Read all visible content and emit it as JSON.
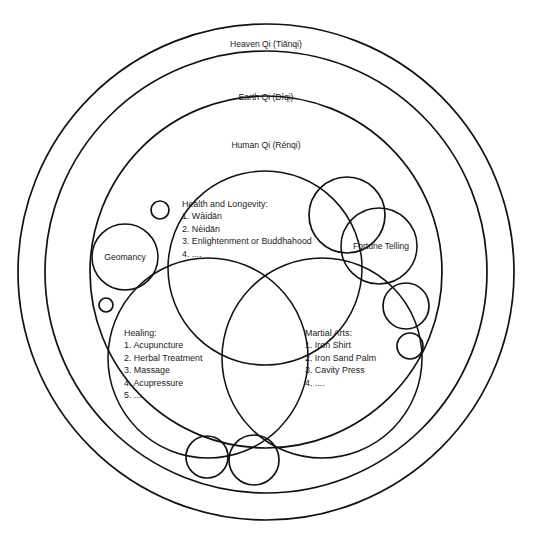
{
  "diagram": {
    "title_rings": [
      {
        "id": "heaven",
        "label": "Heaven Qi (Tiānqi)",
        "cx": 266,
        "cy": 272,
        "r": 248,
        "label_x": 266,
        "label_y": 47
      },
      {
        "id": "earth",
        "label": "Earth Qi (Dìqi)",
        "cx": 266,
        "cy": 272,
        "r": 221,
        "label_x": 266,
        "label_y": 100
      },
      {
        "id": "human",
        "label": "Human Qi (Rénqi)",
        "cx": 266,
        "cy": 272,
        "r": 176,
        "label_x": 266,
        "label_y": 148
      }
    ],
    "domains": [
      {
        "id": "health",
        "heading": "Health and Longevity:",
        "items": [
          "1. Wàidān",
          "2. Nèidān",
          "3. Enlightenment or Buddhahood",
          "4. ...."
        ],
        "cx": 265,
        "cy": 268,
        "r": 97,
        "text_x": 182,
        "text_y": 207
      },
      {
        "id": "healing",
        "heading": "Healing:",
        "items": [
          "1. Acupuncture",
          "2. Herbal Treatment",
          "3. Massage",
          "4. Acupressure",
          "5. ...."
        ],
        "cx": 208,
        "cy": 358,
        "r": 100,
        "text_x": 124,
        "text_y": 336
      },
      {
        "id": "martial",
        "heading": "Martial Arts:",
        "items": [
          "1. Iron Shirt",
          "2. Iron Sand Palm",
          "3. Cavity Press",
          "4. ...."
        ],
        "cx": 322,
        "cy": 358,
        "r": 100,
        "text_x": 305,
        "text_y": 336
      }
    ],
    "nodes": [
      {
        "id": "geomancy",
        "label": "Geomancy",
        "cx": 125,
        "cy": 257,
        "r": 33,
        "label_x": 125,
        "label_y": 260
      },
      {
        "id": "fortune-telling",
        "label": "Fortune Telling",
        "cx": 379,
        "cy": 246,
        "r": 38,
        "label_x": 381,
        "label_y": 249
      }
    ],
    "unlabeled_circles": [
      {
        "id": "circle-top-right-large",
        "cx": 347,
        "cy": 215,
        "r": 38
      },
      {
        "id": "circle-right-mid",
        "cx": 406,
        "cy": 306,
        "r": 23
      },
      {
        "id": "circle-right-lower",
        "cx": 410,
        "cy": 346,
        "r": 13
      },
      {
        "id": "circle-upper-left-small",
        "cx": 160,
        "cy": 210,
        "r": 9
      },
      {
        "id": "circle-left-tiny",
        "cx": 106,
        "cy": 305,
        "r": 7
      },
      {
        "id": "circle-bottom-left",
        "cx": 207,
        "cy": 457,
        "r": 21
      },
      {
        "id": "circle-bottom-right",
        "cx": 254,
        "cy": 460,
        "r": 25
      }
    ],
    "colors": {
      "stroke": "#111111",
      "text": "#1a1a1a",
      "background": "#ffffff"
    }
  }
}
